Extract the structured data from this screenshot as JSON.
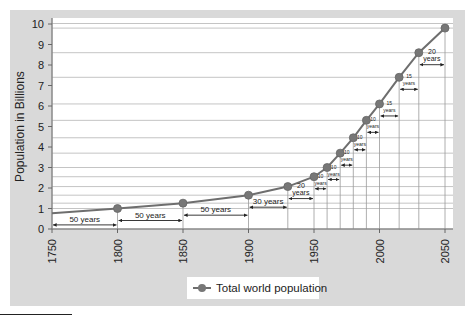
{
  "chart_data": {
    "type": "line",
    "title": "",
    "xlabel": "",
    "ylabel": "Population in Billions",
    "xlim": [
      1750,
      2050
    ],
    "ylim": [
      0,
      10
    ],
    "x_ticks": [
      "1750",
      "1800",
      "1850",
      "1900",
      "1950",
      "2000",
      "2050"
    ],
    "y_ticks": [
      "0",
      "1",
      "2",
      "3",
      "4",
      "5",
      "6",
      "7",
      "8",
      "9",
      "10"
    ],
    "grid": "horizontal lines at each data point value plus vertical drop lines at each marker",
    "legend": {
      "position": "bottom-center",
      "entries": [
        "Total world population"
      ]
    },
    "series": [
      {
        "name": "Total world population",
        "color": "#6e6e6e",
        "line_start": {
          "x": 1750,
          "y": 0.77
        },
        "x": [
          1800,
          1850,
          1900,
          1930,
          1950,
          1960,
          1970,
          1980,
          1990,
          2000,
          2015,
          2030,
          2050
        ],
        "values": [
          1.0,
          1.26,
          1.65,
          2.07,
          2.55,
          3.0,
          3.7,
          4.45,
          5.3,
          6.1,
          7.4,
          8.6,
          9.8
        ]
      }
    ],
    "annotations": [
      {
        "from": 1750,
        "to": 1800,
        "label": "50 years"
      },
      {
        "from": 1800,
        "to": 1850,
        "label": "50 years"
      },
      {
        "from": 1850,
        "to": 1900,
        "label": "50 years"
      },
      {
        "from": 1900,
        "to": 1930,
        "label": "30 years"
      },
      {
        "from": 1930,
        "to": 1950,
        "label": "20 years"
      },
      {
        "from": 1950,
        "to": 1960,
        "label": "10 years"
      },
      {
        "from": 1960,
        "to": 1970,
        "label": "10 years"
      },
      {
        "from": 1970,
        "to": 1980,
        "label": "10 years"
      },
      {
        "from": 1980,
        "to": 1990,
        "label": "10 years"
      },
      {
        "from": 1990,
        "to": 2000,
        "label": "10 years"
      },
      {
        "from": 2000,
        "to": 2015,
        "label": "15 years"
      },
      {
        "from": 2015,
        "to": 2030,
        "label": "15 years"
      },
      {
        "from": 2030,
        "to": 2050,
        "label": "20 years"
      }
    ]
  },
  "legend": {
    "label": "Total world population"
  },
  "axis": {
    "ylabel": "Population in Billions"
  }
}
